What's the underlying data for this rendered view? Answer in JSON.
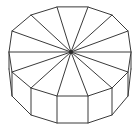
{
  "figure": {
    "shape_name": "dodecagonal-prism",
    "background_color": "#ffffff",
    "stroke_color": "#3a3a3a",
    "fill_color": "#ffffff",
    "stroke_width": 1,
    "canvas": {
      "width": 140,
      "height": 126
    },
    "apex": {
      "x": 71,
      "y": 52,
      "label": "center-of-top-face"
    },
    "top_face": {
      "sides": 12,
      "vertex_count": 12,
      "vertices": [
        {
          "i": 0,
          "x": 88,
          "y": 7
        },
        {
          "i": 1,
          "x": 112,
          "y": 15
        },
        {
          "i": 2,
          "x": 128,
          "y": 31
        },
        {
          "i": 3,
          "x": 131,
          "y": 52
        },
        {
          "i": 4,
          "x": 128,
          "y": 72
        },
        {
          "i": 5,
          "x": 112,
          "y": 88
        },
        {
          "i": 6,
          "x": 88,
          "y": 96
        },
        {
          "i": 7,
          "x": 57,
          "y": 96
        },
        {
          "i": 8,
          "x": 31,
          "y": 88
        },
        {
          "i": 9,
          "x": 12,
          "y": 72
        },
        {
          "i": 10,
          "x": 9,
          "y": 52
        },
        {
          "i": 11,
          "x": 12,
          "y": 31
        },
        {
          "i": 12,
          "x": 31,
          "y": 15
        },
        {
          "i": 13,
          "x": 57,
          "y": 7
        }
      ]
    },
    "side_wall": {
      "depth": 27,
      "visible_from_vertex": 5,
      "visible_to_vertex": 10,
      "vertical_edges": [
        {
          "x": 9,
          "y_top": 52,
          "y_bottom": 69
        },
        {
          "x": 12,
          "y_top": 72,
          "y_bottom": 96
        },
        {
          "x": 31,
          "y_top": 88,
          "y_bottom": 115
        },
        {
          "x": 57,
          "y_top": 96,
          "y_bottom": 123
        },
        {
          "x": 88,
          "y_top": 96,
          "y_bottom": 123
        },
        {
          "x": 112,
          "y_top": 88,
          "y_bottom": 115
        },
        {
          "x": 128,
          "y_top": 72,
          "y_bottom": 96
        },
        {
          "x": 131,
          "y_top": 52,
          "y_bottom": 69
        }
      ],
      "bottom_outline": [
        {
          "x": 9,
          "y": 69
        },
        {
          "x": 12,
          "y": 96
        },
        {
          "x": 31,
          "y": 115
        },
        {
          "x": 57,
          "y": 123
        },
        {
          "x": 88,
          "y": 123
        },
        {
          "x": 112,
          "y": 115
        },
        {
          "x": 128,
          "y": 96
        },
        {
          "x": 131,
          "y": 69
        }
      ]
    },
    "fan_lines": {
      "count": 12,
      "from": "apex",
      "to": "each top-face vertex"
    }
  }
}
